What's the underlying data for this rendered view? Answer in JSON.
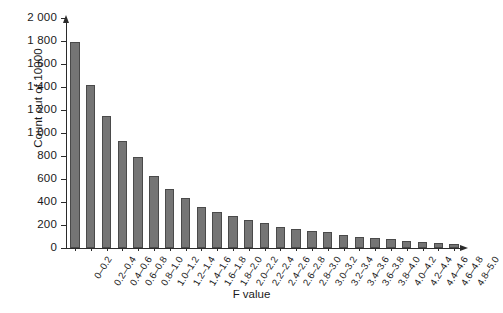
{
  "chart_data": {
    "type": "bar",
    "title": "",
    "xlabel": "F value",
    "ylabel": "Count out of 10000",
    "ylim": [
      0,
      2000
    ],
    "ytick_labels": [
      "0",
      "200",
      "400",
      "600",
      "800",
      "1 000",
      "1 200",
      "1 400",
      "1 600",
      "1 800",
      "2 000"
    ],
    "ytick_values": [
      0,
      200,
      400,
      600,
      800,
      1000,
      1200,
      1400,
      1600,
      1800,
      2000
    ],
    "grid": false,
    "legend": null,
    "bar_color": "#757575",
    "bar_edge_color": "#4a4a4a",
    "axis_color": "#2b2b2b",
    "categories": [
      "0–0.2",
      "0.2–0.4",
      "0.4–0.6",
      "0.6–0.8",
      "0.8–1.0",
      "1.0–1.2",
      "1.2–1.4",
      "1.4–1.6",
      "1.6–1.8",
      "1.8–2.0",
      "2.0–2.2",
      "2.2–2.4",
      "2.4–2.6",
      "2.6–2.8",
      "2.8–3.0",
      "3.0–3.2",
      "3.2–3.4",
      "3.4–3.6",
      "3.6–3.8",
      "3.8–4.0",
      "4.0–4.2",
      "4.2–4.4",
      "4.4–4.6",
      "4.6–4.8",
      "4.8–5.0"
    ],
    "values": [
      1790,
      1420,
      1150,
      930,
      790,
      625,
      515,
      435,
      355,
      315,
      280,
      240,
      215,
      185,
      165,
      150,
      135,
      115,
      100,
      85,
      75,
      65,
      55,
      45,
      35
    ]
  }
}
